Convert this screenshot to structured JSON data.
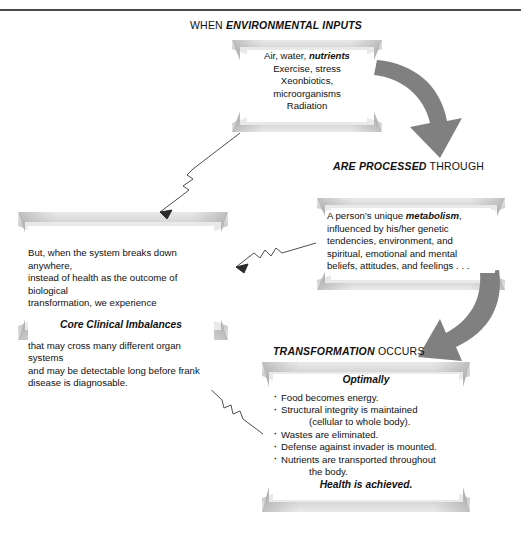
{
  "diagram": {
    "top_rule_color": "#4a4a4a",
    "background_color": "#ffffff",
    "bowtie_color": "#9a9a9a",
    "arrow_color": "#808080",
    "text_color": "#111111"
  },
  "headings": {
    "inputs": {
      "plain_prefix": "WHEN ",
      "emphasis": "ENVIRONMENTAL INPUTS",
      "plain_suffix": ""
    },
    "processed": {
      "plain_prefix": "",
      "emphasis": "ARE PROCESSED",
      "plain_suffix": " THROUGH"
    },
    "transformation": {
      "plain_prefix": "",
      "emphasis": "TRANSFORMATION",
      "plain_suffix": " OCCURS"
    }
  },
  "boxes": {
    "inputs": {
      "name": "environmental-inputs",
      "line1_plain": "Air, water, ",
      "line1_emphasis": "nutrients",
      "line2": "Exercise, stress",
      "line3": "Xeonbiotics,",
      "line4": "microorganisms",
      "line5": "Radiation"
    },
    "metabolism": {
      "name": "metabolism",
      "line1_plain": "A person’s unique ",
      "line1_emphasis": "metabolism",
      "line1_tail": ",",
      "line2": "influenced by his/her genetic",
      "line3": "tendencies, environment, and",
      "line4": "spiritual, emotional and mental",
      "line5": "beliefs, attitudes, and feelings . . ."
    },
    "imbalance": {
      "name": "core-clinical-imbalances",
      "intro_line1": "But, when the system breaks down anywhere,",
      "intro_line2": "instead of health as the outcome of biological",
      "intro_line3": "transformation, we experience",
      "subheading": "Core Clinical Imbalances",
      "outro_line1": "that may cross many different organ systems",
      "outro_line2": "and may be detectable long before frank",
      "outro_line3": "disease is diagnosable."
    },
    "optimal": {
      "name": "optimal-transformation",
      "subheading": "Optimally",
      "bullets": [
        {
          "text": "Food becomes energy.",
          "continuation": ""
        },
        {
          "text": "Structural integrity is maintained",
          "continuation": "(cellular to whole body)."
        },
        {
          "text": "Wastes are eliminated.",
          "continuation": ""
        },
        {
          "text": "Defense against invader is mounted.",
          "continuation": ""
        },
        {
          "text": "Nutrients are transported throughout",
          "continuation": "the body."
        }
      ],
      "closing": "Health is achieved."
    }
  },
  "connectors": {
    "big_arrow_1": "curved-arrow-inputs-to-metabolism",
    "big_arrow_2": "curved-arrow-metabolism-to-transformation",
    "zigzag_1": "zigzag-arrow-inputs-to-imbalance",
    "zigzag_2": "zigzag-arrow-metabolism-to-imbalance",
    "zigzag_3": "zigzag-arrow-optimal-to-imbalance"
  }
}
